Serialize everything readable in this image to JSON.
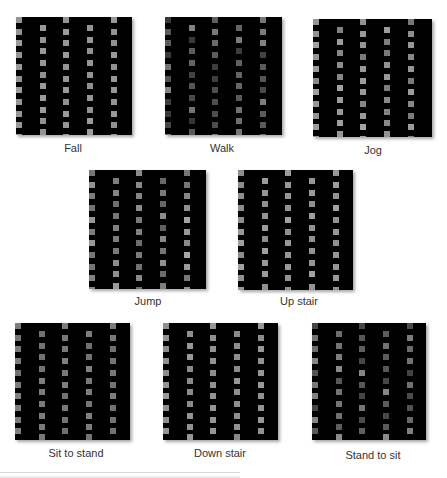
{
  "figure": {
    "panels": [
      {
        "id": "fall",
        "label": "Fall",
        "x": 16,
        "y": 17,
        "w": 116,
        "h": 118,
        "lx": 73,
        "ly": 142,
        "level": [
          150,
          150,
          150,
          150,
          150
        ],
        "variance": 6
      },
      {
        "id": "walk",
        "label": "Walk",
        "x": 165,
        "y": 17,
        "w": 117,
        "h": 118,
        "lx": 222,
        "ly": 142,
        "level": [
          95,
          90,
          100,
          95,
          95
        ],
        "variance": 40
      },
      {
        "id": "jog",
        "label": "Jog",
        "x": 313,
        "y": 19,
        "w": 119,
        "h": 118,
        "lx": 373,
        "ly": 144,
        "level": [
          140,
          140,
          145,
          140,
          140
        ],
        "variance": 22
      },
      {
        "id": "jump",
        "label": "Jump",
        "x": 89,
        "y": 170,
        "w": 117,
        "h": 119,
        "lx": 148,
        "ly": 295,
        "level": [
          125,
          125,
          130,
          125,
          135
        ],
        "variance": 30
      },
      {
        "id": "up-stair",
        "label": "Up stair",
        "x": 238,
        "y": 170,
        "w": 115,
        "h": 120,
        "lx": 299,
        "ly": 295,
        "level": [
          150,
          150,
          150,
          150,
          150
        ],
        "variance": 10
      },
      {
        "id": "sit-to-stand",
        "label": "Sit to stand",
        "x": 15,
        "y": 323,
        "w": 115,
        "h": 117,
        "lx": 76,
        "ly": 447,
        "level": [
          120,
          120,
          120,
          120,
          120
        ],
        "variance": 8
      },
      {
        "id": "down-stair",
        "label": "Down stair",
        "x": 163,
        "y": 323,
        "w": 115,
        "h": 117,
        "lx": 220,
        "ly": 447,
        "level": [
          145,
          145,
          145,
          145,
          145
        ],
        "variance": 8
      },
      {
        "id": "stand-to-sit",
        "label": "Stand to sit",
        "x": 312,
        "y": 323,
        "w": 114,
        "h": 117,
        "lx": 373,
        "ly": 449,
        "level": [
          100,
          105,
          100,
          105,
          100
        ],
        "variance": 35
      }
    ],
    "grid": {
      "columns": 5,
      "column_offsets": [
        0,
        24,
        47,
        71,
        95
      ],
      "row_pitch": 11.7,
      "square_size": 6,
      "odd_rows": 11,
      "even_rows": 10
    }
  }
}
